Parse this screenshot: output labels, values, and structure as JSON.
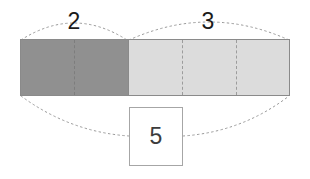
{
  "diagram": {
    "type": "part-part-whole-bar-model",
    "title": "",
    "canvas": {
      "width": 310,
      "height": 179,
      "background": "#ffffff"
    },
    "bar": {
      "x": 20,
      "y": 39,
      "width": 270,
      "height": 57,
      "border_color": "#8a8a8a"
    },
    "parts": [
      {
        "id": "part-dark",
        "label": "2",
        "value": 2,
        "units": 2,
        "fill": "#909090",
        "x": 20,
        "width": 108,
        "label_x": 74,
        "dividers": [
          74
        ]
      },
      {
        "id": "part-light",
        "label": "3",
        "value": 3,
        "units": 3,
        "fill": "#dcdcdc",
        "x": 128,
        "width": 162,
        "label_x": 208,
        "dividers": [
          182,
          236
        ]
      }
    ],
    "total": {
      "label": "5",
      "value": 5,
      "box": {
        "x": 129,
        "y": 107,
        "width": 54,
        "height": 59
      },
      "border_color": "#a6a6a6",
      "text_color": "#3c3c3c"
    },
    "braces": {
      "style": "dotted-arc",
      "color": "#9a9a9a",
      "top": [
        {
          "for": "part-dark",
          "from_x": 20,
          "to_x": 128,
          "label": "2"
        },
        {
          "for": "part-light",
          "from_x": 128,
          "to_x": 290,
          "label": "3"
        }
      ],
      "bottom": [
        {
          "for": "total",
          "from_x": 20,
          "to_x": 290,
          "label": "5"
        }
      ]
    },
    "colors": {
      "part_dark": "#909090",
      "part_light": "#dcdcdc",
      "bar_outline": "#8a8a8a",
      "divider": "#7d7d7d",
      "brace": "#9a9a9a",
      "label_text": "#1b1b1b",
      "total_text": "#3c3c3c",
      "background": "#ffffff"
    }
  }
}
